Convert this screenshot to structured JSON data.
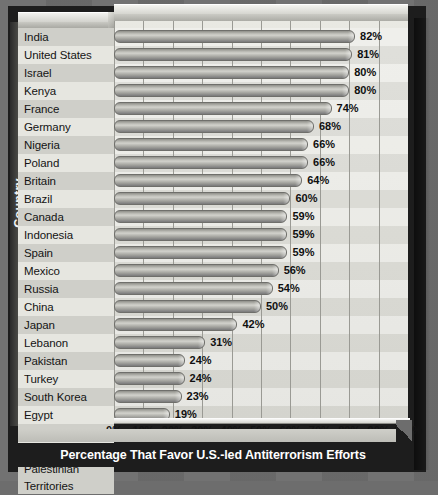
{
  "chart_data": {
    "type": "bar",
    "orientation": "horizontal",
    "title": "Percentage That Favor U.S.-led Antiterrorism Efforts",
    "xlabel": "",
    "ylabel": "Country",
    "xlim": [
      0,
      100
    ],
    "xticks": [
      "0%",
      "10%",
      "20%",
      "30%",
      "40%",
      "50%",
      "60%",
      "70%",
      "80%",
      "90%",
      "100%"
    ],
    "grid": true,
    "legend": "none",
    "value_suffix": "%",
    "categories": [
      "India",
      "United States",
      "Israel",
      "Kenya",
      "France",
      "Germany",
      "Nigeria",
      "Poland",
      "Britain",
      "Brazil",
      "Canada",
      "Indonesia",
      "Spain",
      "Mexico",
      "Russia",
      "China",
      "Japan",
      "Lebanon",
      "Pakistan",
      "Turkey",
      "South Korea",
      "Egypt",
      "Argentina",
      "Jordan",
      "Palestinian Territories"
    ],
    "values": [
      82,
      81,
      80,
      80,
      74,
      68,
      66,
      66,
      64,
      60,
      59,
      59,
      59,
      56,
      54,
      50,
      42,
      31,
      24,
      24,
      23,
      19,
      11,
      11,
      10
    ],
    "value_labels": [
      "82%",
      "81%",
      "80%",
      "80%",
      "74%",
      "68%",
      "66%",
      "66%",
      "64%",
      "60%",
      "59%",
      "59%",
      "59%",
      "56%",
      "54%",
      "50%",
      "42%",
      "31%",
      "24%",
      "24%",
      "23%",
      "19%",
      "11%",
      "11%",
      "10%"
    ]
  },
  "colors": {
    "background": "#6d6d6d",
    "panel": "#1d1d1d",
    "plot_background": "#e4e4de",
    "bar": "#a8a8a2",
    "bar_outline": "#6f6f6b",
    "gridline": "#9a9a94",
    "title_text": "#ffffff",
    "label_text": "#141414"
  },
  "axis": {
    "y_title": "Country"
  }
}
